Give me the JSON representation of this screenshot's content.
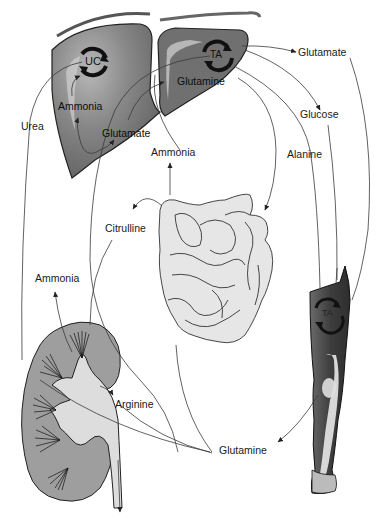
{
  "diagram": {
    "type": "metabolic-flow",
    "organs": [
      "liver",
      "small-intestine",
      "kidney",
      "leg-muscle"
    ],
    "cycles": {
      "liver_urea_cycle": "UC",
      "liver_ta": "TA",
      "muscle_ta": "TA"
    },
    "labels": {
      "liver_ammonia": "Ammonia",
      "liver_glutamate": "Glutamate",
      "liver_glutamine": "Glutamine",
      "urea": "Urea",
      "top_glutamate": "Glutamate",
      "glucose": "Glucose",
      "alanine": "Alanine",
      "gut_ammonia": "Ammonia",
      "citrulline": "Citrulline",
      "kidney_ammonia": "Ammonia",
      "arginine": "Arginine",
      "bottom_glutamine": "Glutamine"
    },
    "colors": {
      "liver": "#7a7a7a",
      "liver_highlight": "#bdbdbd",
      "intestine": "#e4e4e4",
      "kidney": "#9a9a9a",
      "kidney_pelvis": "#dcdcdc",
      "muscle": "#4a4a4a",
      "line": "#3a3a3a",
      "background": "#ffffff"
    }
  }
}
